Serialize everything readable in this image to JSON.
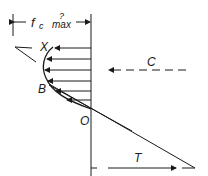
{
  "diagram": {
    "title_label": "f",
    "title_subscript": "c",
    "title_max": "max",
    "title_question": "?",
    "labels": {
      "x": "X",
      "b": "B",
      "o": "O",
      "c": "C",
      "t": "T"
    },
    "colors": {
      "line": "#1a1a1a",
      "background": "#ffffff"
    }
  }
}
